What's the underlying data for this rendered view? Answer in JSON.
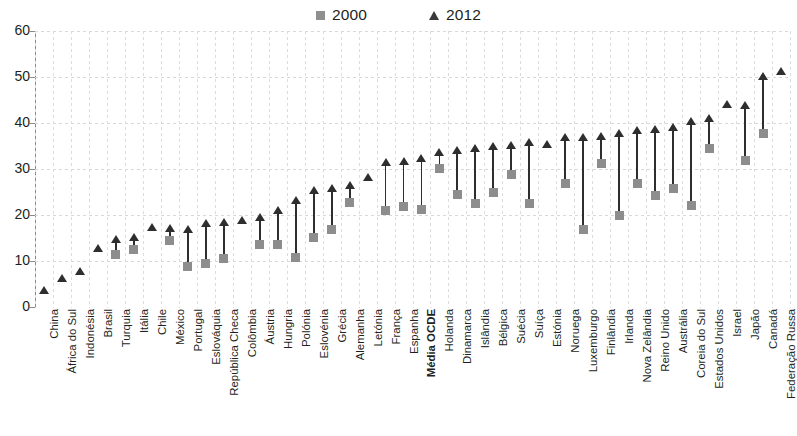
{
  "chart_data": {
    "type": "scatter",
    "title": "",
    "subtitle": "",
    "xlabel": "",
    "ylabel": "",
    "ylim": [
      0,
      60
    ],
    "yticks": [
      0,
      10,
      20,
      30,
      40,
      50,
      60
    ],
    "grid": true,
    "legend_position": "top-center",
    "legend": [
      {
        "name": "2000",
        "marker": "square",
        "color": "#8d8d8d"
      },
      {
        "name": "2012",
        "marker": "triangle",
        "color": "#2e2e2e"
      }
    ],
    "categories": [
      "China",
      "África do Sul",
      "Indonésia",
      "Brasil",
      "Turquia",
      "Itália",
      "Chile",
      "México",
      "Portugal",
      "Eslováquia",
      "República Checa",
      "Colômbia",
      "Áustria",
      "Hungria",
      "Polónia",
      "Eslovénia",
      "Grécia",
      "Alemanha",
      "Letónia",
      "França",
      "Espanha",
      "Média OCDE",
      "Holanda",
      "Dinamarca",
      "Islândia",
      "Bélgica",
      "Suécia",
      "Suíça",
      "Estónia",
      "Noruega",
      "Luxemburgo",
      "Finlândia",
      "Irlanda",
      "Nova Zelândia",
      "Reino Unido",
      "Austrália",
      "Coreia do Sul",
      "Estados Unidos",
      "Israel",
      "Japão",
      "Canadá",
      "Federação Russa"
    ],
    "emphasized_categories": [
      "Média OCDE"
    ],
    "series": [
      {
        "name": "2000",
        "marker": "square",
        "color": "#8d8d8d",
        "values": [
          null,
          null,
          null,
          null,
          11.5,
          12.5,
          null,
          14.5,
          8.8,
          9.5,
          10.5,
          null,
          13.5,
          13.5,
          10.8,
          15.2,
          16.8,
          22.8,
          null,
          21.0,
          21.8,
          21.2,
          30.2,
          24.5,
          22.5,
          24.8,
          28.8,
          22.5,
          null,
          26.8,
          16.8,
          31.2,
          19.8,
          26.8,
          24.2,
          25.8,
          22.0,
          34.5,
          null,
          31.8,
          37.8,
          null
        ]
      },
      {
        "name": "2012",
        "marker": "triangle",
        "color": "#2e2e2e",
        "values": [
          3.8,
          6.2,
          7.8,
          12.8,
          14.8,
          15.2,
          17.5,
          17.2,
          17.0,
          18.2,
          18.5,
          19.0,
          19.5,
          21.0,
          23.2,
          25.5,
          25.8,
          26.5,
          28.2,
          31.5,
          31.8,
          32.5,
          33.8,
          34.2,
          34.5,
          35.0,
          35.2,
          35.8,
          35.5,
          37.0,
          37.0,
          37.2,
          37.8,
          38.5,
          38.8,
          39.2,
          40.5,
          41.0,
          44.2,
          44.0,
          50.2,
          51.2
        ]
      }
    ]
  }
}
